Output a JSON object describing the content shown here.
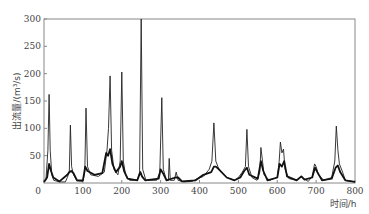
{
  "chart_data": {
    "type": "line",
    "title": "",
    "xlabel": "时间/h",
    "ylabel": "出流量/(m³/s)",
    "xlim": [
      0,
      800
    ],
    "ylim": [
      0,
      300
    ],
    "xticks": [
      0,
      100,
      200,
      300,
      400,
      500,
      600,
      700,
      800
    ],
    "yticks": [
      50,
      100,
      150,
      200,
      250,
      300
    ],
    "ytick_labels_extra": [
      "0"
    ],
    "grid": false,
    "legend": null,
    "series": [
      {
        "name": "observed/sharp series (thin dark line)",
        "color": "#222222",
        "points": [
          [
            0,
            2
          ],
          [
            5,
            5
          ],
          [
            10,
            60
          ],
          [
            13,
            162
          ],
          [
            16,
            60
          ],
          [
            20,
            15
          ],
          [
            25,
            5
          ],
          [
            40,
            2
          ],
          [
            55,
            2
          ],
          [
            60,
            10
          ],
          [
            65,
            20
          ],
          [
            68,
            106
          ],
          [
            71,
            30
          ],
          [
            76,
            15
          ],
          [
            85,
            4
          ],
          [
            100,
            3
          ],
          [
            105,
            20
          ],
          [
            108,
            137
          ],
          [
            112,
            30
          ],
          [
            120,
            15
          ],
          [
            140,
            12
          ],
          [
            155,
            20
          ],
          [
            162,
            60
          ],
          [
            166,
            100
          ],
          [
            170,
            196
          ],
          [
            174,
            60
          ],
          [
            180,
            25
          ],
          [
            190,
            15
          ],
          [
            196,
            40
          ],
          [
            200,
            203
          ],
          [
            204,
            40
          ],
          [
            210,
            15
          ],
          [
            220,
            5
          ],
          [
            240,
            5
          ],
          [
            246,
            20
          ],
          [
            250,
            300
          ],
          [
            254,
            25
          ],
          [
            262,
            5
          ],
          [
            290,
            5
          ],
          [
            298,
            20
          ],
          [
            303,
            156
          ],
          [
            307,
            25
          ],
          [
            315,
            5
          ],
          [
            320,
            5
          ],
          [
            322,
            45
          ],
          [
            325,
            5
          ],
          [
            335,
            5
          ],
          [
            340,
            20
          ],
          [
            345,
            5
          ],
          [
            360,
            2
          ],
          [
            380,
            3
          ],
          [
            395,
            8
          ],
          [
            410,
            12
          ],
          [
            425,
            25
          ],
          [
            432,
            40
          ],
          [
            437,
            110
          ],
          [
            442,
            40
          ],
          [
            450,
            25
          ],
          [
            470,
            10
          ],
          [
            490,
            5
          ],
          [
            500,
            10
          ],
          [
            510,
            20
          ],
          [
            518,
            30
          ],
          [
            522,
            98
          ],
          [
            526,
            30
          ],
          [
            535,
            10
          ],
          [
            548,
            5
          ],
          [
            555,
            20
          ],
          [
            558,
            65
          ],
          [
            562,
            40
          ],
          [
            566,
            15
          ],
          [
            580,
            5
          ],
          [
            600,
            10
          ],
          [
            605,
            40
          ],
          [
            608,
            75
          ],
          [
            612,
            55
          ],
          [
            616,
            62
          ],
          [
            620,
            25
          ],
          [
            630,
            8
          ],
          [
            650,
            5
          ],
          [
            660,
            12
          ],
          [
            668,
            8
          ],
          [
            680,
            3
          ],
          [
            690,
            12
          ],
          [
            696,
            35
          ],
          [
            700,
            30
          ],
          [
            706,
            15
          ],
          [
            720,
            5
          ],
          [
            740,
            10
          ],
          [
            748,
            40
          ],
          [
            752,
            104
          ],
          [
            756,
            60
          ],
          [
            760,
            35
          ],
          [
            768,
            20
          ],
          [
            775,
            5
          ],
          [
            800,
            2
          ]
        ]
      },
      {
        "name": "simulated series (thick smooth line)",
        "color": "#111111",
        "points": [
          [
            0,
            2
          ],
          [
            8,
            10
          ],
          [
            13,
            35
          ],
          [
            18,
            22
          ],
          [
            24,
            10
          ],
          [
            40,
            3
          ],
          [
            60,
            15
          ],
          [
            65,
            20
          ],
          [
            70,
            22
          ],
          [
            76,
            18
          ],
          [
            85,
            5
          ],
          [
            100,
            5
          ],
          [
            106,
            30
          ],
          [
            112,
            22
          ],
          [
            130,
            15
          ],
          [
            150,
            18
          ],
          [
            160,
            55
          ],
          [
            165,
            50
          ],
          [
            170,
            62
          ],
          [
            176,
            35
          ],
          [
            185,
            20
          ],
          [
            196,
            30
          ],
          [
            200,
            40
          ],
          [
            206,
            22
          ],
          [
            215,
            8
          ],
          [
            240,
            5
          ],
          [
            248,
            20
          ],
          [
            252,
            12
          ],
          [
            260,
            5
          ],
          [
            295,
            8
          ],
          [
            300,
            25
          ],
          [
            306,
            18
          ],
          [
            315,
            5
          ],
          [
            338,
            10
          ],
          [
            345,
            10
          ],
          [
            355,
            3
          ],
          [
            390,
            5
          ],
          [
            410,
            15
          ],
          [
            430,
            20
          ],
          [
            437,
            30
          ],
          [
            442,
            30
          ],
          [
            450,
            25
          ],
          [
            470,
            10
          ],
          [
            490,
            5
          ],
          [
            505,
            10
          ],
          [
            515,
            22
          ],
          [
            522,
            28
          ],
          [
            528,
            15
          ],
          [
            550,
            8
          ],
          [
            558,
            40
          ],
          [
            564,
            22
          ],
          [
            575,
            5
          ],
          [
            600,
            10
          ],
          [
            606,
            35
          ],
          [
            612,
            30
          ],
          [
            618,
            40
          ],
          [
            625,
            12
          ],
          [
            650,
            5
          ],
          [
            662,
            12
          ],
          [
            670,
            6
          ],
          [
            690,
            10
          ],
          [
            697,
            28
          ],
          [
            703,
            20
          ],
          [
            715,
            5
          ],
          [
            740,
            8
          ],
          [
            750,
            28
          ],
          [
            756,
            32
          ],
          [
            762,
            20
          ],
          [
            775,
            5
          ],
          [
            800,
            2
          ]
        ]
      }
    ]
  },
  "axes": {
    "x_title": "时间/h",
    "y_title": "出流量/(m³/s)",
    "x_tick_labels": [
      "0",
      "100",
      "200",
      "300",
      "400",
      "500",
      "600",
      "700",
      "800"
    ],
    "y_tick_labels": [
      "50",
      "100",
      "150",
      "200",
      "250",
      "300"
    ]
  }
}
